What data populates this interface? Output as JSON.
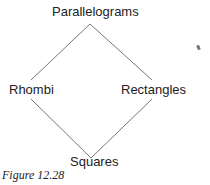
{
  "diagram": {
    "nodes": {
      "top": "Parallelograms",
      "left": "Rhombi",
      "right": "Rectangles",
      "bottom": "Squares"
    },
    "edges": [
      [
        "Parallelograms",
        "Rhombi"
      ],
      [
        "Parallelograms",
        "Rectangles"
      ],
      [
        "Rhombi",
        "Squares"
      ],
      [
        "Rectangles",
        "Squares"
      ]
    ],
    "caption": "Figure 12.28",
    "line_color": "#777777"
  }
}
